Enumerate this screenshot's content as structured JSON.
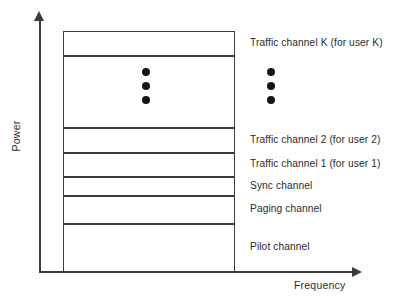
{
  "figure": {
    "axes": {
      "y_title": "Power",
      "x_title": "Frequency"
    }
  },
  "chart_data": {
    "type": "bar",
    "title": "",
    "xlabel": "Frequency",
    "ylabel": "Power",
    "orientation": "stacked-vertical",
    "grid": false,
    "legend": null,
    "categories": [
      "Pilot channel",
      "Paging channel",
      "Sync channel",
      "Traffic channel 1 (for user 1)",
      "Traffic channel 2 (for user 2)",
      "Traffic channel K (for user K)"
    ],
    "bands": [
      {
        "label": "Traffic channel K (for user K)",
        "top": 0,
        "height": 25,
        "show_label": true,
        "has_dots": false
      },
      {
        "label": "",
        "top": 25,
        "height": 72,
        "show_label": false,
        "has_dots": true
      },
      {
        "label": "Traffic channel 2 (for user 2)",
        "top": 97,
        "height": 25,
        "show_label": true,
        "has_dots": false
      },
      {
        "label": "Traffic channel 1 (for user 1)",
        "top": 122,
        "height": 24,
        "show_label": true,
        "has_dots": false
      },
      {
        "label": "Sync channel",
        "top": 146,
        "height": 19,
        "show_label": true,
        "has_dots": false
      },
      {
        "label": "Paging channel",
        "top": 165,
        "height": 28,
        "show_label": true,
        "has_dots": false
      },
      {
        "label": "Pilot channel",
        "top": 193,
        "height": 48,
        "show_label": true,
        "has_dots": false
      }
    ],
    "ellipsis": {
      "glyph": "vertical-ellipsis",
      "dot_count": 3,
      "dot_spacing": 14,
      "columns": [
        "inside-stack",
        "outside-stack"
      ]
    },
    "colors": {
      "stroke": "#3a3a3a",
      "fill": "#ffffff",
      "dot": "#151515",
      "text": "#2b2b2b"
    }
  }
}
